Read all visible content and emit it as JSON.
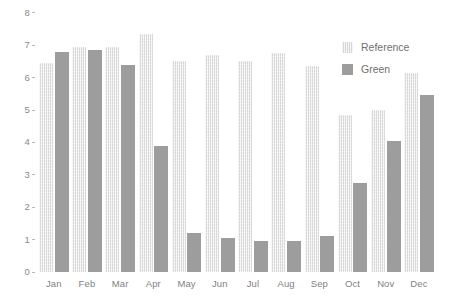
{
  "chart_data": {
    "type": "bar",
    "title": "",
    "subtitle": "",
    "xlabel": "",
    "ylabel": "",
    "categories": [
      "Jan",
      "Feb",
      "Mar",
      "Apr",
      "May",
      "Jun",
      "Jul",
      "Aug",
      "Sep",
      "Oct",
      "Nov",
      "Dec"
    ],
    "series": [
      {
        "name": "Reference",
        "color": "#d6d6d6",
        "values": [
          6.45,
          6.95,
          6.95,
          7.35,
          6.5,
          6.7,
          6.5,
          6.75,
          6.35,
          4.85,
          5.0,
          6.15
        ]
      },
      {
        "name": "Green",
        "color": "#9d9d9d",
        "values": [
          6.8,
          6.85,
          6.4,
          3.9,
          1.2,
          1.05,
          0.95,
          0.95,
          1.1,
          2.75,
          4.05,
          5.45
        ]
      }
    ],
    "ylim": [
      0,
      8
    ],
    "yticks": [
      0,
      1,
      2,
      3,
      4,
      5,
      6,
      7,
      8
    ],
    "ytick_labels": [
      "0",
      "1",
      "2",
      "3",
      "4",
      "5",
      "6",
      "7",
      "8"
    ],
    "grid": false,
    "legend_position": "top-right",
    "legend_entries": [
      "Reference",
      "Green"
    ],
    "annotations": [],
    "background_color": "#ffffff",
    "axis_text_color": "#8a8a8a"
  }
}
